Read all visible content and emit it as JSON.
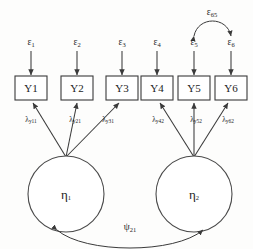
{
  "diagram": {
    "type": "sem-path-diagram",
    "background_color": "#fdfdfc",
    "line_color": "#3a3a3a",
    "text_color": "#1c1c1c"
  },
  "indicators": [
    {
      "id": "y1",
      "label": "Y1",
      "x": 56,
      "y": 90
    },
    {
      "id": "y2",
      "label": "Y2",
      "x": 97,
      "y": 90
    },
    {
      "id": "y3",
      "label": "Y3",
      "x": 138,
      "y": 90
    },
    {
      "id": "y4",
      "label": "Y4",
      "x": 186,
      "y": 90
    },
    {
      "id": "y5",
      "label": "Y5",
      "x": 227,
      "y": 90
    },
    {
      "id": "y6",
      "label": "Y6",
      "x": 268,
      "y": 90
    }
  ],
  "errors": [
    {
      "id": "e1",
      "symbol": "ε",
      "subscript": "1"
    },
    {
      "id": "e2",
      "symbol": "ε",
      "subscript": "2"
    },
    {
      "id": "e3",
      "symbol": "ε",
      "subscript": "3"
    },
    {
      "id": "e4",
      "symbol": "ε",
      "subscript": "4"
    },
    {
      "id": "e5",
      "symbol": "ε",
      "subscript": "5"
    },
    {
      "id": "e6",
      "symbol": "ε",
      "subscript": "6"
    }
  ],
  "factors": [
    {
      "id": "eta1",
      "symbol": "η",
      "subscript": "1"
    },
    {
      "id": "eta2",
      "symbol": "η",
      "subscript": "2"
    }
  ],
  "loadings": [
    {
      "id": "ly11",
      "symbol": "λ",
      "subscript": "y11"
    },
    {
      "id": "ly21",
      "symbol": "λ",
      "subscript": "y21"
    },
    {
      "id": "ly31",
      "symbol": "λ",
      "subscript": "y31"
    },
    {
      "id": "ly42",
      "symbol": "λ",
      "subscript": "y42"
    },
    {
      "id": "ly52",
      "symbol": "λ",
      "subscript": "y52"
    },
    {
      "id": "ly62",
      "symbol": "λ",
      "subscript": "y62"
    }
  ],
  "covariances": [
    {
      "id": "psi21",
      "symbol": "ψ",
      "subscript": "21",
      "kind": "factor-covariance"
    },
    {
      "id": "eps65",
      "symbol": "ε",
      "subscript": "65",
      "kind": "residual-covariance"
    }
  ]
}
